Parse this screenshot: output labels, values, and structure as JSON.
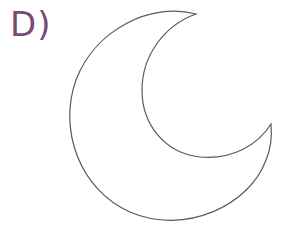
{
  "option": {
    "label": "D)",
    "label_color": "#7a4a78"
  },
  "figure": {
    "shape": "crescent-moon",
    "stroke_color": "#5a5a5a",
    "fill_color": "#ffffff"
  }
}
